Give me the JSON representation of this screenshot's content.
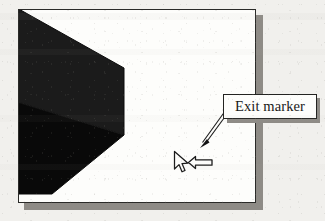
{
  "figure": {
    "background_color": "#f1f0ed",
    "type": "annotated-screenshot-figure"
  },
  "panel": {
    "name": "viewport-panel",
    "fill_color": "#fdfdfb",
    "border_color": "#2a2a28",
    "shadow_color": "#8e8b86"
  },
  "scene": {
    "block": {
      "name": "isometric-black-block",
      "top_face_color": "#1e1e1e",
      "front_face_color": "#0a0a0a"
    }
  },
  "cursor": {
    "name": "mouse-pointer",
    "stroke_color": "#1a1a1a",
    "fill_color": "#fdfdfb"
  },
  "exit_arrow": {
    "name": "exit-direction-block-arrow",
    "direction": "left",
    "stroke_color": "#1a1a1a",
    "fill_color": "#fdfdfb"
  },
  "callout": {
    "label": "Exit marker",
    "box_fill": "#fdfdfb",
    "box_border": "#232321",
    "box_shadow": "#8e8b86",
    "leader": {
      "name": "callout-leader-arrow",
      "points_to": "exit-direction-block-arrow",
      "color": "#1a1a1a"
    }
  }
}
